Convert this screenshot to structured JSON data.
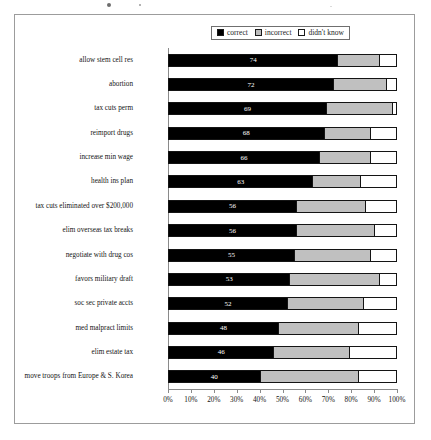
{
  "chart_data": {
    "type": "bar",
    "subtype": "stacked-horizontal-100-percent",
    "title": "",
    "xlabel": "",
    "ylabel": "",
    "xlim": [
      0,
      100
    ],
    "grid": false,
    "legend_position": "top-center",
    "x_tick_labels": [
      "0%",
      "10%",
      "20%",
      "30%",
      "40%",
      "50%",
      "60%",
      "70%",
      "80%",
      "90%",
      "100%"
    ],
    "x_tick_values": [
      0,
      10,
      20,
      30,
      40,
      50,
      60,
      70,
      80,
      90,
      100
    ],
    "categories": [
      "allow stem cell res",
      "abortion",
      "tax cuts perm",
      "reimport drugs",
      "increase min wage",
      "health ins plan",
      "tax cuts eliminated over $200,000",
      "elim overseas tax breaks",
      "negotiate with drug cos",
      "favors military draft",
      "soc sec private accts",
      "med malpract limits",
      "elim estate tax",
      "move troops from Europe & S. Korea"
    ],
    "series": [
      {
        "name": "correct",
        "color": "#000000",
        "values": [
          74,
          72,
          69,
          68,
          66,
          63,
          56,
          56,
          55,
          53,
          52,
          48,
          46,
          40
        ],
        "labels": [
          "74",
          "72",
          "69",
          "68",
          "66",
          "63",
          "56",
          "56",
          "55",
          "53",
          "52",
          "48",
          "46",
          "40"
        ]
      },
      {
        "name": "incorrect",
        "color": "#c0c0c0",
        "values": [
          18,
          23,
          29,
          20,
          22,
          21,
          30,
          34,
          33,
          39,
          33,
          35,
          33,
          43
        ]
      },
      {
        "name": "didn't know",
        "color": "#ffffff",
        "values": [
          8,
          5,
          2,
          12,
          12,
          16,
          14,
          10,
          12,
          8,
          15,
          17,
          21,
          17
        ]
      }
    ]
  },
  "legend": {
    "entries": [
      {
        "label": "correct",
        "swatch": "legend-swatch-black"
      },
      {
        "label": "incorrect",
        "swatch": "legend-swatch-gray"
      },
      {
        "label": "didn't know",
        "swatch": "legend-swatch-white"
      }
    ]
  }
}
